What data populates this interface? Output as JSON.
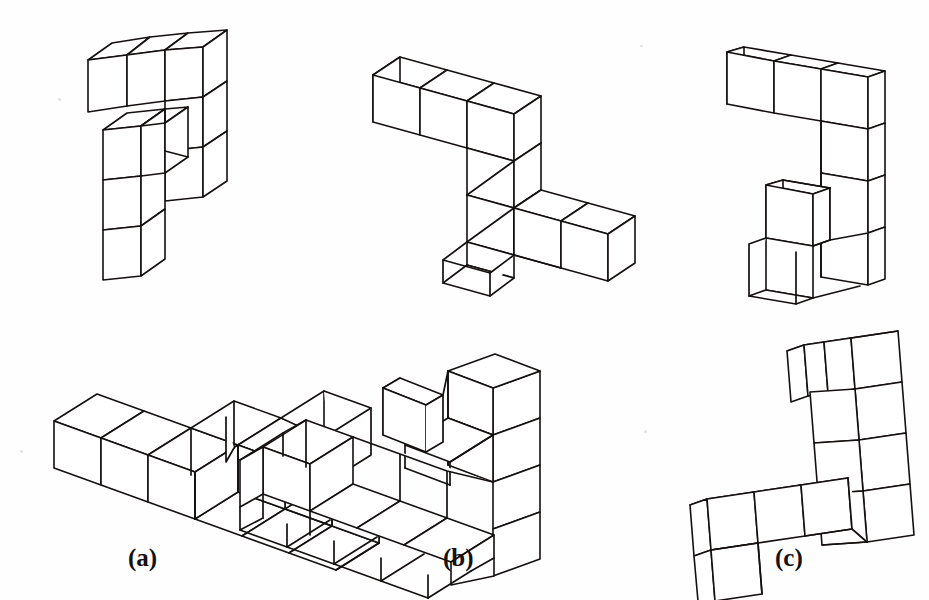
{
  "page": {
    "background_color": "#fefefe",
    "ink_color": "#14100f",
    "width": 929,
    "height": 600
  },
  "labels": [
    {
      "id": "a",
      "text": "(a)",
      "x": 128,
      "y": 544
    },
    {
      "id": "b",
      "text": "(b)",
      "x": 443,
      "y": 544
    },
    {
      "id": "c",
      "text": "(c)",
      "x": 775,
      "y": 544
    }
  ],
  "figures": [
    {
      "id": "top-a",
      "name": "cube-figure-top-a",
      "row": "top",
      "column": "a",
      "cube_count": 9,
      "caption_ref": "(a)"
    },
    {
      "id": "top-b",
      "name": "cube-figure-top-b",
      "row": "top",
      "column": "b",
      "cube_count": 9,
      "caption_ref": "(b)"
    },
    {
      "id": "top-c",
      "name": "cube-figure-top-c",
      "row": "top",
      "column": "c",
      "cube_count": 9,
      "caption_ref": "(c)"
    },
    {
      "id": "bottom-a",
      "name": "cube-figure-bottom-a",
      "row": "bottom",
      "column": "a",
      "cube_count": 9,
      "caption_ref": "(a)"
    },
    {
      "id": "bottom-b",
      "name": "cube-figure-bottom-b",
      "row": "bottom",
      "column": "b",
      "cube_count": 9,
      "caption_ref": "(b)"
    },
    {
      "id": "bottom-c",
      "name": "cube-figure-bottom-c",
      "row": "bottom",
      "column": "c",
      "cube_count": 9,
      "caption_ref": "(c)"
    }
  ],
  "geometry": {
    "top_a": {
      "origin": [
        96,
        118
      ],
      "ex": [
        38,
        13
      ],
      "ey": [
        22,
        -17
      ],
      "ez": [
        0,
        47
      ],
      "cubes": [
        [
          0,
          0,
          0
        ],
        [
          1,
          0,
          0
        ],
        [
          2,
          0,
          0
        ],
        [
          2,
          0,
          1
        ],
        [
          2,
          0,
          2
        ],
        [
          0,
          1,
          1
        ],
        [
          0,
          1,
          2
        ],
        [
          0,
          1,
          3
        ],
        [
          1,
          1,
          1
        ]
      ]
    },
    "top_b": {
      "origin": [
        432,
        130
      ],
      "ex": [
        47,
        15
      ],
      "ey": [
        27,
        -21
      ],
      "ez": [
        0,
        49
      ],
      "cubes": [
        [
          0,
          0,
          0
        ],
        [
          1,
          0,
          0
        ],
        [
          2,
          0,
          0
        ],
        [
          2,
          0,
          1
        ],
        [
          2,
          0,
          2
        ],
        [
          2,
          1,
          2
        ],
        [
          2,
          2,
          2
        ],
        [
          3,
          2,
          2
        ],
        [
          4,
          2,
          2
        ]
      ]
    },
    "top_c": {
      "origin": [
        760,
        118
      ],
      "ex": [
        40,
        10
      ],
      "ey": [
        19,
        -16
      ],
      "ez": [
        -6,
        46
      ],
      "cubes": [
        [
          0,
          0,
          0
        ],
        [
          1,
          0,
          0
        ],
        [
          2,
          0,
          0
        ],
        [
          2,
          0,
          1
        ],
        [
          2,
          0,
          2
        ],
        [
          2,
          0,
          3
        ],
        [
          1,
          0,
          3
        ],
        [
          1,
          0,
          2
        ],
        [
          1,
          1,
          3
        ]
      ]
    },
    "bottom_a": {
      "origin": [
        110,
        435
      ],
      "ex": [
        47,
        17
      ],
      "ey": [
        43,
        -27
      ],
      "ez": [
        6,
        47
      ],
      "cubes": [
        [
          0,
          0,
          0
        ],
        [
          1,
          0,
          0
        ],
        [
          2,
          0,
          0
        ],
        [
          2,
          1,
          0
        ],
        [
          3,
          1,
          0
        ],
        [
          2,
          2,
          0
        ],
        [
          3,
          2,
          0
        ],
        [
          2,
          3,
          0
        ],
        [
          3,
          3,
          0
        ]
      ]
    },
    "bottom_b": {
      "origin": [
        400,
        475
      ],
      "ex": [
        48,
        16
      ],
      "ey": [
        44,
        -26
      ],
      "ez": [
        0,
        -52
      ],
      "cubes": [
        [
          0,
          0,
          0
        ],
        [
          1,
          0,
          0
        ],
        [
          2,
          0,
          0
        ],
        [
          3,
          0,
          0
        ],
        [
          3,
          0,
          1
        ],
        [
          3,
          0,
          2
        ],
        [
          3,
          1,
          1
        ],
        [
          3,
          1,
          2
        ],
        [
          2,
          1,
          1
        ]
      ]
    },
    "bottom_c": {
      "origin": [
        700,
        500
      ],
      "ex": [
        47,
        -7
      ],
      "ey": [
        17,
        -40
      ],
      "ez": [
        2,
        48
      ],
      "cubes": [
        [
          0,
          0,
          0
        ],
        [
          1,
          0,
          0
        ],
        [
          2,
          0,
          0
        ],
        [
          3,
          0,
          0
        ],
        [
          0,
          0,
          1
        ],
        [
          3,
          1,
          0
        ],
        [
          3,
          2,
          0
        ],
        [
          3,
          3,
          0
        ],
        [
          4,
          3,
          0
        ]
      ]
    }
  }
}
